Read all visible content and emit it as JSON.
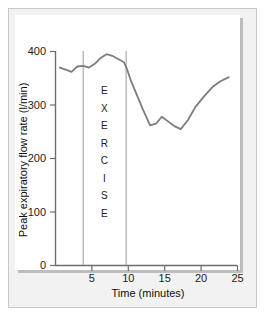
{
  "chart_data": {
    "type": "line",
    "title": "",
    "xlabel": "Time (minutes)",
    "ylabel": "Peak expiratory flow rate (l/min)",
    "xlim": [
      0,
      25
    ],
    "ylim": [
      0,
      400
    ],
    "xticks": [
      5,
      10,
      15,
      20,
      25
    ],
    "xtick_labels": [
      "5",
      "10",
      "15",
      "20",
      "25"
    ],
    "yticks": [
      0,
      100,
      200,
      300,
      400
    ],
    "ytick_labels": [
      "0",
      "100",
      "200",
      "300",
      "400"
    ],
    "grid": false,
    "legend": false,
    "line_color": "#7d7d7d",
    "background_color": "#ffffff",
    "panel_color": "#f2f2f2",
    "series": [
      {
        "name": "Peak expiratory flow rate",
        "x": [
          0.6,
          1.4,
          2.2,
          3.0,
          3.8,
          4.6,
          5.4,
          6.2,
          7.0,
          7.8,
          8.6,
          9.4,
          9.8,
          10.4,
          11.2,
          12.0,
          13.0,
          13.8,
          14.6,
          15.6,
          16.4,
          17.2,
          18.2,
          19.2,
          20.4,
          21.6,
          22.6,
          23.8
        ],
        "y": [
          370,
          366,
          362,
          372,
          373,
          370,
          377,
          388,
          395,
          392,
          386,
          380,
          368,
          344,
          318,
          292,
          262,
          265,
          278,
          268,
          260,
          255,
          272,
          296,
          316,
          334,
          344,
          352
        ]
      }
    ],
    "annotations": [
      {
        "name": "exercise-start-line",
        "type": "vline",
        "x": 3.8
      },
      {
        "name": "exercise-end-line",
        "type": "vline",
        "x": 9.7
      },
      {
        "name": "exercise-label",
        "type": "vertical-text",
        "text": "EXERCISE",
        "letters": [
          "E",
          "X",
          "E",
          "R",
          "C",
          "I",
          "S",
          "E"
        ],
        "x": 6.7,
        "y_top": 320
      }
    ]
  }
}
